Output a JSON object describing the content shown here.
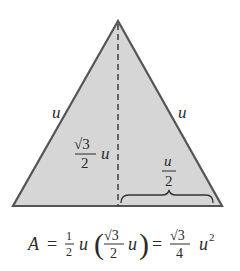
{
  "diagram": {
    "colors": {
      "fill": "#d6d6d6",
      "stroke": "#555555",
      "text": "#2a2a2a"
    },
    "labels": {
      "left_side": "u",
      "right_side": "u",
      "height_num": "√3",
      "height_den": "2",
      "height_var": "u",
      "half_base_num": "u",
      "half_base_den": "2"
    },
    "formula": {
      "lhs": "A",
      "eq1": "=",
      "half_num": "1",
      "half_den": "2",
      "u1": "u",
      "lparen": "(",
      "h_num": "√3",
      "h_den": "2",
      "u2": "u",
      "rparen": ")",
      "eq2": "=",
      "r_num": "√3",
      "r_den": "4",
      "u3": "u",
      "exp": "2"
    }
  }
}
